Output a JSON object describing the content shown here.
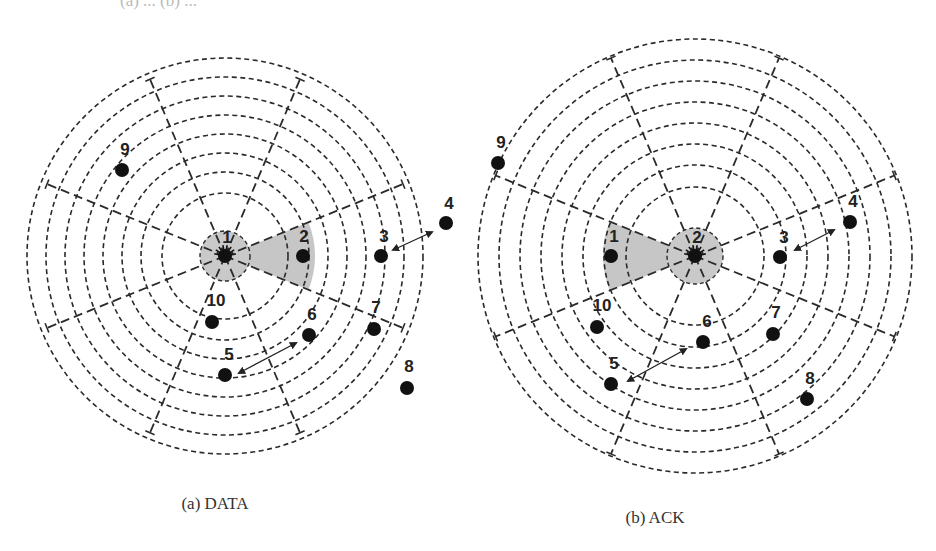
{
  "top_cut_text": "(a) ... (b) ...",
  "panels": [
    {
      "id": "a",
      "caption": "(a) DATA",
      "caption_pos": [
        215,
        509
      ],
      "center": [
        225,
        256
      ],
      "center_node_label": "1",
      "ring_radii": [
        63,
        84,
        103,
        122,
        141,
        160,
        179,
        198
      ],
      "inner_zone_radius": 25,
      "spoke_angles_deg": [
        22,
        67,
        113,
        158,
        202,
        247,
        293,
        338
      ],
      "spoke_length": 192,
      "wedge": {
        "angle_from_deg": -22,
        "angle_to_deg": 22,
        "radius": 90,
        "direction": "right"
      },
      "nodes": [
        {
          "label": "2",
          "pos": [
            303,
            256
          ],
          "label_pos": [
            304,
            242
          ]
        },
        {
          "label": "3",
          "pos": [
            381,
            256
          ],
          "label_pos": [
            384,
            242
          ]
        },
        {
          "label": "4",
          "pos": [
            446,
            223
          ],
          "label_pos": [
            449,
            209
          ]
        },
        {
          "label": "5",
          "pos": [
            225,
            375
          ],
          "label_pos": [
            229,
            360
          ]
        },
        {
          "label": "6",
          "pos": [
            309,
            335
          ],
          "label_pos": [
            312,
            320
          ]
        },
        {
          "label": "7",
          "pos": [
            374,
            329
          ],
          "label_pos": [
            376,
            313
          ]
        },
        {
          "label": "8",
          "pos": [
            407,
            388
          ],
          "label_pos": [
            409,
            372
          ]
        },
        {
          "label": "9",
          "pos": [
            122,
            170
          ],
          "label_pos": [
            125,
            155
          ]
        },
        {
          "label": "10",
          "pos": [
            212,
            322
          ],
          "label_pos": [
            216,
            306
          ]
        }
      ],
      "arrows": [
        {
          "between": [
            "3",
            "4"
          ],
          "from": [
            393,
            250
          ],
          "to": [
            432,
            232
          ]
        },
        {
          "between": [
            "5",
            "6"
          ],
          "from": [
            239,
            373
          ],
          "to": [
            296,
            343
          ]
        }
      ]
    },
    {
      "id": "b",
      "caption": "(b) ACK",
      "caption_pos": [
        655,
        523
      ],
      "center": [
        695,
        256
      ],
      "center_node_label": "2",
      "ring_radii": [
        69,
        91,
        112,
        133,
        154,
        175,
        196,
        217
      ],
      "inner_zone_radius": 28,
      "spoke_angles_deg": [
        22,
        67,
        113,
        158,
        202,
        247,
        293,
        338
      ],
      "spoke_length": 215,
      "wedge": {
        "angle_from_deg": 158,
        "angle_to_deg": 202,
        "radius": 92,
        "direction": "left"
      },
      "nodes": [
        {
          "label": "1",
          "pos": [
            611,
            256
          ],
          "label_pos": [
            614,
            242
          ]
        },
        {
          "label": "3",
          "pos": [
            780,
            257
          ],
          "label_pos": [
            784,
            243
          ]
        },
        {
          "label": "4",
          "pos": [
            850,
            222
          ],
          "label_pos": [
            853,
            207
          ]
        },
        {
          "label": "5",
          "pos": [
            611,
            384
          ],
          "label_pos": [
            614,
            369
          ]
        },
        {
          "label": "6",
          "pos": [
            703,
            342
          ],
          "label_pos": [
            707,
            327
          ]
        },
        {
          "label": "7",
          "pos": [
            773,
            334
          ],
          "label_pos": [
            776,
            318
          ]
        },
        {
          "label": "8",
          "pos": [
            807,
            399
          ],
          "label_pos": [
            810,
            384
          ]
        },
        {
          "label": "9",
          "pos": [
            498,
            163
          ],
          "label_pos": [
            501,
            148
          ]
        },
        {
          "label": "10",
          "pos": [
            597,
            327
          ],
          "label_pos": [
            602,
            311
          ]
        }
      ],
      "arrows": [
        {
          "between": [
            "3",
            "4"
          ],
          "from": [
            795,
            250
          ],
          "to": [
            834,
            230
          ]
        },
        {
          "between": [
            "5",
            "6"
          ],
          "from": [
            628,
            381
          ],
          "to": [
            686,
            349
          ]
        }
      ]
    }
  ],
  "colors": {
    "shade": "#c6c6c6",
    "ink": "#111111",
    "ring": "#2a2a2a"
  }
}
